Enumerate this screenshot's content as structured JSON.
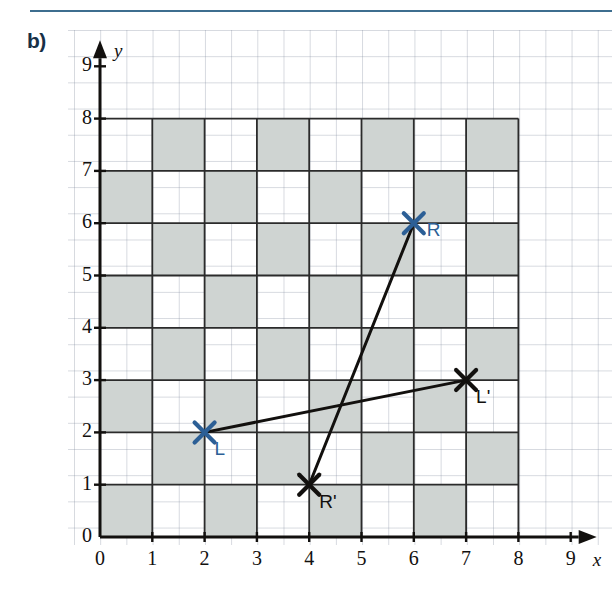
{
  "figure": {
    "part_label": "b)",
    "accent_color": "#3d6e8f",
    "label_color": "#173047"
  },
  "chart_data": {
    "type": "scatter",
    "title": "",
    "xlabel": "x",
    "ylabel": "y",
    "xlim": [
      0,
      9
    ],
    "ylim": [
      0,
      9
    ],
    "x_ticks": [
      "0",
      "1",
      "2",
      "3",
      "4",
      "5",
      "6",
      "7",
      "8",
      "9"
    ],
    "y_ticks": [
      "0",
      "1",
      "2",
      "3",
      "4",
      "5",
      "6",
      "7",
      "8",
      "9"
    ],
    "grid": true,
    "grid_extent": [
      8,
      8
    ],
    "grid_pattern": "checkerboard",
    "grid_shaded_rule": "shaded when (col + row) is even",
    "shaded_color": "#cfd4d2",
    "points": [
      {
        "name": "L",
        "x": 2,
        "y": 2,
        "color": "#2c5f96",
        "marker": "x",
        "label": "L",
        "label_pos": "below-right"
      },
      {
        "name": "R",
        "x": 6,
        "y": 6,
        "color": "#2c5f96",
        "marker": "x",
        "label": "R",
        "label_pos": "right"
      },
      {
        "name": "R'",
        "x": 4,
        "y": 1,
        "color": "#12100e",
        "marker": "x",
        "label": "R'",
        "label_pos": "below-right"
      },
      {
        "name": "L'",
        "x": 7,
        "y": 3,
        "color": "#12100e",
        "marker": "x",
        "label": "L'",
        "label_pos": "below-right"
      }
    ],
    "segments": [
      {
        "name": "segment-R-to-Rprime",
        "from": "R",
        "to": "R'",
        "color": "#12100e"
      },
      {
        "name": "segment-L-to-Lprime",
        "from": "L",
        "to": "L'",
        "color": "#12100e"
      }
    ],
    "legend": []
  }
}
